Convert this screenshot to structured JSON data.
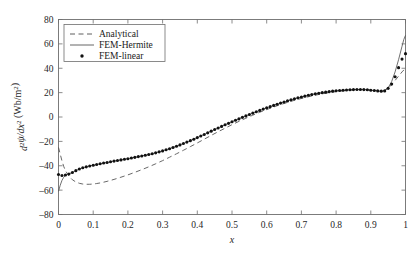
{
  "chart_data": {
    "type": "line",
    "title": "",
    "xlabel": "x",
    "ylabel": "d²ψ/dx² (Wb/m²)",
    "ylabel_parts": {
      "d": "d",
      "sup2_a": "2",
      "psi": "ψ",
      "slash_dx": "/dx",
      "sup2_b": "2",
      "units": " (Wb/m",
      "units_sup": "2",
      "units_close": ")"
    },
    "xlim": [
      0,
      1
    ],
    "ylim": [
      -80,
      80
    ],
    "xticks": [
      0,
      0.1,
      0.2,
      0.3,
      0.4,
      0.5,
      0.6,
      0.7,
      0.8,
      0.9,
      1
    ],
    "xtick_labels": [
      "0",
      "0.1",
      "0.2",
      "0.3",
      "0.4",
      "0.5",
      "0.6",
      "0.7",
      "0.8",
      "0.9",
      "1"
    ],
    "yticks": [
      -80,
      -60,
      -40,
      -20,
      0,
      20,
      40,
      60,
      80
    ],
    "ytick_labels": [
      "–80",
      "–60",
      "–40",
      "–20",
      "0",
      "20",
      "40",
      "60",
      "80"
    ],
    "grid": false,
    "legend_position": "upper left",
    "legend_entries": [
      {
        "label": "Analytical",
        "style": "dashed"
      },
      {
        "label": "FEM-Hermite",
        "style": "solid"
      },
      {
        "label": "FEM-linear",
        "style": "marker-dot"
      }
    ],
    "series": [
      {
        "name": "Analytical",
        "style": "dashed",
        "x": [
          0.0,
          0.005,
          0.01,
          0.015,
          0.02,
          0.03,
          0.04,
          0.05,
          0.06,
          0.07,
          0.08,
          0.09,
          0.1,
          0.11,
          0.12,
          0.13,
          0.14,
          0.15,
          0.16,
          0.18,
          0.2,
          0.22,
          0.24,
          0.26,
          0.28,
          0.3,
          0.32,
          0.34,
          0.36,
          0.38,
          0.4,
          0.42,
          0.44,
          0.46,
          0.48,
          0.5,
          0.52,
          0.54,
          0.56,
          0.58,
          0.6,
          0.62,
          0.64,
          0.66,
          0.68,
          0.7,
          0.72,
          0.74,
          0.76,
          0.78,
          0.8,
          0.82,
          0.84,
          0.86,
          0.87,
          0.88,
          0.89,
          0.9,
          0.91,
          0.92,
          0.93,
          0.94,
          0.95,
          0.96,
          0.97,
          0.98,
          0.99,
          1.0
        ],
        "y": [
          -25.0,
          -30.5,
          -36.0,
          -40.5,
          -44.0,
          -48.5,
          -51.5,
          -53.3,
          -54.4,
          -55.0,
          -55.2,
          -55.2,
          -55.0,
          -54.6,
          -54.1,
          -53.5,
          -52.8,
          -52.0,
          -51.2,
          -49.4,
          -47.5,
          -45.4,
          -43.2,
          -40.9,
          -38.4,
          -35.8,
          -33.0,
          -30.2,
          -27.3,
          -24.3,
          -21.3,
          -18.2,
          -15.1,
          -12.1,
          -9.2,
          -6.3,
          -3.6,
          -1.0,
          1.5,
          3.9,
          6.1,
          8.2,
          10.2,
          12.0,
          13.7,
          15.2,
          16.6,
          17.9,
          19.0,
          20.0,
          20.8,
          21.5,
          22.0,
          22.4,
          22.5,
          22.5,
          22.4,
          22.2,
          21.9,
          21.6,
          21.3,
          21.8,
          23.5,
          26.5,
          30.0,
          33.5,
          37.0,
          40.0
        ]
      },
      {
        "name": "FEM-Hermite",
        "style": "solid",
        "x": [
          0.0,
          0.005,
          0.01,
          0.015,
          0.02,
          0.025,
          0.03,
          0.04,
          0.05,
          0.06,
          0.07,
          0.08,
          0.09,
          0.1,
          0.12,
          0.14,
          0.16,
          0.18,
          0.2,
          0.22,
          0.24,
          0.26,
          0.28,
          0.3,
          0.32,
          0.34,
          0.36,
          0.38,
          0.4,
          0.42,
          0.44,
          0.46,
          0.48,
          0.5,
          0.52,
          0.54,
          0.56,
          0.58,
          0.6,
          0.62,
          0.64,
          0.66,
          0.68,
          0.7,
          0.72,
          0.74,
          0.76,
          0.78,
          0.8,
          0.82,
          0.84,
          0.86,
          0.87,
          0.88,
          0.89,
          0.9,
          0.91,
          0.92,
          0.93,
          0.935,
          0.94,
          0.95,
          0.96,
          0.97,
          0.98,
          0.99,
          0.995,
          1.0
        ],
        "y": [
          -61.0,
          -56.0,
          -52.0,
          -49.5,
          -48.0,
          -47.3,
          -46.8,
          -45.5,
          -44.0,
          -42.7,
          -41.7,
          -40.9,
          -40.2,
          -39.6,
          -38.4,
          -37.3,
          -36.2,
          -35.2,
          -34.2,
          -33.1,
          -32.0,
          -30.8,
          -29.4,
          -27.8,
          -26.0,
          -24.0,
          -21.8,
          -19.4,
          -16.9,
          -14.3,
          -11.6,
          -9.0,
          -6.4,
          -3.9,
          -1.5,
          0.9,
          3.2,
          5.4,
          7.5,
          9.5,
          11.4,
          13.2,
          14.9,
          16.4,
          17.8,
          19.0,
          20.0,
          20.8,
          21.5,
          22.0,
          22.4,
          22.6,
          22.6,
          22.5,
          22.3,
          22.0,
          21.7,
          21.4,
          21.2,
          21.3,
          21.8,
          24.0,
          29.0,
          37.0,
          47.0,
          58.0,
          63.5,
          67.0
        ]
      },
      {
        "name": "FEM-linear",
        "style": "marker-dot",
        "x": [
          0.0,
          0.01,
          0.02,
          0.03,
          0.04,
          0.05,
          0.06,
          0.07,
          0.08,
          0.09,
          0.1,
          0.11,
          0.12,
          0.13,
          0.14,
          0.15,
          0.16,
          0.17,
          0.18,
          0.19,
          0.2,
          0.21,
          0.22,
          0.23,
          0.24,
          0.25,
          0.26,
          0.27,
          0.28,
          0.29,
          0.3,
          0.31,
          0.32,
          0.33,
          0.34,
          0.35,
          0.36,
          0.37,
          0.38,
          0.39,
          0.4,
          0.41,
          0.42,
          0.43,
          0.44,
          0.45,
          0.46,
          0.47,
          0.48,
          0.49,
          0.5,
          0.51,
          0.52,
          0.53,
          0.54,
          0.55,
          0.56,
          0.57,
          0.58,
          0.59,
          0.6,
          0.61,
          0.62,
          0.63,
          0.64,
          0.65,
          0.66,
          0.67,
          0.68,
          0.69,
          0.7,
          0.71,
          0.72,
          0.73,
          0.74,
          0.75,
          0.76,
          0.77,
          0.78,
          0.79,
          0.8,
          0.81,
          0.82,
          0.83,
          0.84,
          0.85,
          0.86,
          0.87,
          0.88,
          0.89,
          0.9,
          0.91,
          0.92,
          0.93,
          0.94,
          0.95,
          0.96,
          0.97,
          0.98,
          0.99,
          1.0
        ],
        "y": [
          -47.2,
          -48.0,
          -47.6,
          -46.8,
          -45.5,
          -44.0,
          -42.7,
          -41.7,
          -40.9,
          -40.2,
          -39.6,
          -39.0,
          -38.4,
          -37.8,
          -37.3,
          -36.7,
          -36.2,
          -35.7,
          -35.2,
          -34.7,
          -34.2,
          -33.6,
          -33.1,
          -32.5,
          -32.0,
          -31.4,
          -30.8,
          -30.1,
          -29.4,
          -28.6,
          -27.8,
          -26.9,
          -26.0,
          -25.0,
          -24.0,
          -22.9,
          -21.8,
          -20.6,
          -19.4,
          -18.2,
          -16.9,
          -15.6,
          -14.3,
          -13.0,
          -11.6,
          -10.3,
          -9.0,
          -7.7,
          -6.4,
          -5.2,
          -3.9,
          -2.7,
          -1.5,
          -0.3,
          0.9,
          2.1,
          3.2,
          4.3,
          5.4,
          6.5,
          7.5,
          8.5,
          9.5,
          10.5,
          11.4,
          12.3,
          13.2,
          14.1,
          14.9,
          15.7,
          16.4,
          17.1,
          17.8,
          18.4,
          19.0,
          19.5,
          20.0,
          20.4,
          20.8,
          21.2,
          21.5,
          21.8,
          22.0,
          22.2,
          22.4,
          22.5,
          22.6,
          22.6,
          22.5,
          22.3,
          22.0,
          21.7,
          21.4,
          21.2,
          21.4,
          23.5,
          27.0,
          33.0,
          40.5,
          47.5,
          52.0
        ]
      }
    ]
  }
}
